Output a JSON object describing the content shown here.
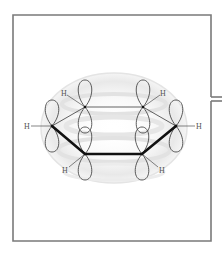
{
  "diagram": {
    "title": "",
    "molecule": "benzene",
    "frame": {
      "left": 13,
      "top": 15,
      "right": 211,
      "bottom": 241,
      "connector_gap_y": [
        97,
        101
      ]
    },
    "colors": {
      "frame": "#7a7a7a",
      "bond": "#111111",
      "orbital": "#333333",
      "cloud": "#e8e8e8",
      "label": "#555555"
    },
    "atoms": [
      {
        "id": "C1",
        "element": "C",
        "x": 52,
        "y": 126
      },
      {
        "id": "C2",
        "element": "C",
        "x": 85,
        "y": 107
      },
      {
        "id": "C3",
        "element": "C",
        "x": 143,
        "y": 107
      },
      {
        "id": "C4",
        "element": "C",
        "x": 176,
        "y": 126
      },
      {
        "id": "C5",
        "element": "C",
        "x": 142,
        "y": 154
      },
      {
        "id": "C6",
        "element": "C",
        "x": 85,
        "y": 154
      }
    ],
    "hydrogens": [
      {
        "label": "H",
        "x": 26,
        "y": 129,
        "bonded_to": "C1"
      },
      {
        "label": "H",
        "x": 62,
        "y": 96,
        "bonded_to": "C2"
      },
      {
        "label": "H",
        "x": 161,
        "y": 96,
        "bonded_to": "C3"
      },
      {
        "label": "H",
        "x": 197,
        "y": 129,
        "bonded_to": "C4"
      },
      {
        "label": "H",
        "x": 160,
        "y": 172,
        "bonded_to": "C5"
      },
      {
        "label": "H",
        "x": 63,
        "y": 172,
        "bonded_to": "C6"
      }
    ],
    "labels": {
      "h1": "H",
      "h2": "H",
      "h3": "H",
      "h4": "H",
      "h5": "H",
      "h6": "H"
    }
  }
}
